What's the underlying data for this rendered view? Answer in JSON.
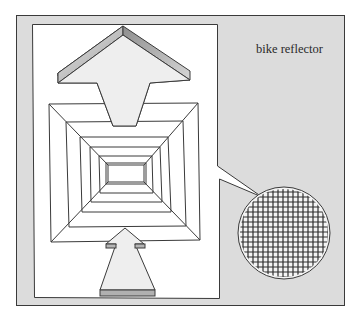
{
  "diagram": {
    "title_label": "bike reflector",
    "colors": {
      "background": "#ffffff",
      "frame_fill": "#dcdcdc",
      "panel_fill": "#ffffff",
      "arrow_fill": "#eeeeee",
      "bevel_fill": "#bdbdbd",
      "stroke": "#3a3a3a",
      "grid_stroke": "#2e2e2e"
    },
    "elements": [
      {
        "name": "outer-frame",
        "kind": "rect"
      },
      {
        "name": "white-panel-with-callout",
        "kind": "polygon"
      },
      {
        "name": "top-arrow",
        "kind": "arrow",
        "direction": "up"
      },
      {
        "name": "concentric-squares",
        "kind": "nested-rectangles",
        "count": 6
      },
      {
        "name": "bottom-arrow",
        "kind": "arrow",
        "direction": "up"
      },
      {
        "name": "magnified-grid-circle",
        "kind": "circle-with-grid"
      }
    ]
  }
}
